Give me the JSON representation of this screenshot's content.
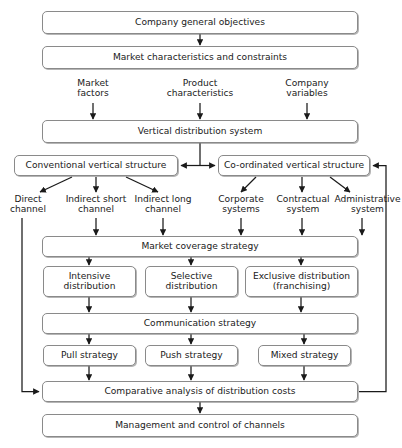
{
  "diagram": {
    "style": {
      "box_border": "#8a8a8a",
      "line": "#1a1a1a",
      "background": "#ffffff",
      "text": "#1a1a1a"
    },
    "nodes": [
      {
        "id": "company_objectives",
        "label": "Company general objectives",
        "x": 42,
        "y": 11,
        "w": 316,
        "h": 23
      },
      {
        "id": "market_characteristics",
        "label": "Market characteristics and constraints",
        "x": 42,
        "y": 46,
        "w": 316,
        "h": 23
      },
      {
        "id": "vertical_distribution",
        "label": "Vertical distribution system",
        "x": 42,
        "y": 120,
        "w": 316,
        "h": 23
      },
      {
        "id": "conventional_structure",
        "label": "Conventional vertical structure",
        "x": 14,
        "y": 155,
        "w": 164,
        "h": 21
      },
      {
        "id": "coordinated_structure",
        "label": "Co-ordinated vertical structure",
        "x": 218,
        "y": 155,
        "w": 152,
        "h": 21
      },
      {
        "id": "market_coverage",
        "label": "Market coverage strategy",
        "x": 42,
        "y": 236,
        "w": 316,
        "h": 21
      },
      {
        "id": "intensive_distribution",
        "label": "Intensive\ndistribution",
        "x": 43,
        "y": 266,
        "w": 93,
        "h": 31
      },
      {
        "id": "selective_distribution",
        "label": "Selective\ndistribution",
        "x": 145,
        "y": 266,
        "w": 93,
        "h": 31
      },
      {
        "id": "exclusive_distribution",
        "label": "Exclusive distribution\n(franchising)",
        "x": 245,
        "y": 266,
        "w": 113,
        "h": 31
      },
      {
        "id": "communication_strategy",
        "label": "Communication strategy",
        "x": 42,
        "y": 313,
        "w": 316,
        "h": 21
      },
      {
        "id": "pull_strategy",
        "label": "Pull strategy",
        "x": 43,
        "y": 345,
        "w": 93,
        "h": 21
      },
      {
        "id": "push_strategy",
        "label": "Push strategy",
        "x": 145,
        "y": 345,
        "w": 93,
        "h": 21
      },
      {
        "id": "mixed_strategy",
        "label": "Mixed strategy",
        "x": 258,
        "y": 345,
        "w": 93,
        "h": 21
      },
      {
        "id": "comparative_analysis",
        "label": "Comparative analysis of distribution costs",
        "x": 42,
        "y": 381,
        "w": 316,
        "h": 21
      },
      {
        "id": "management_control",
        "label": "Management and control of channels",
        "x": 42,
        "y": 414,
        "w": 316,
        "h": 23
      }
    ],
    "labels": [
      {
        "id": "market_factors",
        "line1": "Market",
        "line2": "factors",
        "x": 62,
        "y": 78,
        "w": 62
      },
      {
        "id": "product_characteristics",
        "line1": "Product",
        "line2": "characteristics",
        "x": 164,
        "y": 78,
        "w": 86
      },
      {
        "id": "company_variables",
        "line1": "Company",
        "line2": "variables",
        "x": 288,
        "y": 78,
        "w": 72
      },
      {
        "id": "direct_channel",
        "line1": "Direct",
        "line2": "channel",
        "x": 3,
        "y": 194,
        "w": 56
      },
      {
        "id": "indirect_short_channel",
        "line1": "Indirect",
        "line2": "short channel",
        "x": 58,
        "y": 194,
        "w": 80
      },
      {
        "id": "indirect_long_channel",
        "line1": "Indirect",
        "line2": "long channel",
        "x": 137,
        "y": 194,
        "w": 78
      },
      {
        "id": "corporate_systems",
        "line1": "Corporate",
        "line2": "systems",
        "x": 213,
        "y": 194,
        "w": 62
      },
      {
        "id": "contractual_system",
        "line1": "Contractual",
        "line2": "system",
        "x": 272,
        "y": 194,
        "w": 68
      },
      {
        "id": "administrative_system",
        "line1": "Administrative",
        "line2": "system",
        "x": 333,
        "y": 194,
        "w": 69
      }
    ]
  }
}
